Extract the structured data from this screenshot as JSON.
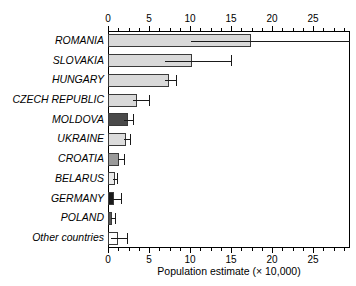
{
  "chart_data": {
    "type": "bar",
    "orientation": "horizontal",
    "title": "",
    "xlabel": "Population estimate (× 10,000)",
    "ylabel": "",
    "xlim": [
      0,
      29.5
    ],
    "xticks": [
      0,
      5,
      10,
      15,
      20,
      25
    ],
    "xtick_labels": [
      "0",
      "5",
      "10",
      "15",
      "20",
      "25"
    ],
    "minor_tick_step": 1.25,
    "grid": false,
    "legend": "none",
    "axis_positions": [
      "top",
      "bottom"
    ],
    "categories": [
      "ROMANIA",
      "SLOVAKIA",
      "HUNGARY",
      "CZECH REPUBLIC",
      "MOLDOVA",
      "UKRAINE",
      "CROATIA",
      "BELARUS",
      "GERMANY",
      "POLAND",
      "Other countries"
    ],
    "values": [
      17.4,
      10.2,
      7.4,
      3.5,
      2.4,
      2.2,
      1.4,
      0.8,
      0.75,
      0.5,
      1.2
    ],
    "error_low": [
      10.1,
      6.9,
      6.9,
      3.1,
      2.0,
      2.0,
      1.2,
      0.6,
      0.3,
      0.35,
      0.35
    ],
    "error_high": [
      29.5,
      15.0,
      8.3,
      5.0,
      3.1,
      2.7,
      2.0,
      1.1,
      1.6,
      0.9,
      2.3
    ],
    "bar_fill_colors": [
      "#d9d9d9",
      "#d9d9d9",
      "#d9d9d9",
      "#d9d9d9",
      "#4a4a4a",
      "#dcdcdc",
      "#9a9a9a",
      "#ebebeb",
      "#1a1a1a",
      "#555555",
      "#ffffff"
    ],
    "bar_edge_color": "#3a3a3a",
    "error_bar_color": "#1a1a1a",
    "frame_color": "#000000",
    "background_color": "#ffffff"
  }
}
